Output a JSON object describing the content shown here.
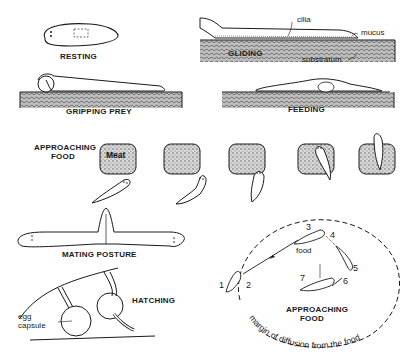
{
  "figure": {
    "panels": [
      {
        "id": "resting",
        "label": "RESTING"
      },
      {
        "id": "gliding",
        "label": "GLIDING",
        "annotations": [
          "cilia",
          "mucus",
          "substratum"
        ]
      },
      {
        "id": "gripping_prey",
        "label": "GRIPPING PREY"
      },
      {
        "id": "feeding",
        "label": "FEEDING"
      },
      {
        "id": "approaching_food_sequence",
        "label_line1": "APPROACHING",
        "label_line2": "FOOD",
        "food_label": "Meat",
        "frames": 5
      },
      {
        "id": "mating_posture",
        "label": "MATING POSTURE"
      },
      {
        "id": "hatching",
        "label": "HATCHING",
        "annotations": [
          "egg",
          "capsule"
        ]
      },
      {
        "id": "approaching_food_path",
        "label_line1": "APPROACHING",
        "label_line2": "FOOD",
        "food_label": "food",
        "steps": [
          "1",
          "2",
          "3",
          "4",
          "5",
          "6",
          "7"
        ],
        "circle_label": "margin of diffusion from the food"
      }
    ]
  },
  "labels": {
    "resting": "RESTING",
    "gliding": "GLIDING",
    "cilia": "cilia",
    "mucus": "mucus",
    "substratum": "substratum",
    "gripping_prey": "GRIPPING PREY",
    "feeding": "FEEDING",
    "approaching_1": "APPROACHING",
    "food_1": "FOOD",
    "meat": "Meat",
    "mating_posture": "MATING POSTURE",
    "hatching": "HATCHING",
    "egg": "egg",
    "capsule": "capsule",
    "food_small": "food",
    "approaching_2": "APPROACHING",
    "food_2": "FOOD",
    "margin": "margin of diffusion from the food",
    "steps": [
      "1",
      "2",
      "3",
      "4",
      "5",
      "6",
      "7"
    ]
  },
  "colors": {
    "ink": "#1a1a1a",
    "stipple": "#9a9a9a",
    "background": "#ffffff"
  }
}
